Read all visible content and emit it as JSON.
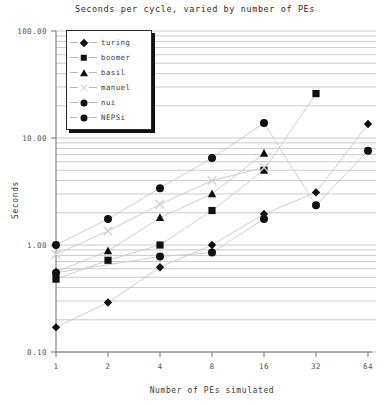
{
  "chart_data": {
    "type": "scatter",
    "title": "Seconds per cycle, varied by number of PEs",
    "xlabel": "Number of PEs simulated",
    "ylabel": "Seconds",
    "xscale": "log2",
    "yscale": "log10",
    "x": [
      1,
      2,
      4,
      8,
      16,
      32,
      64
    ],
    "xticklabels": [
      "1",
      "2",
      "4",
      "8",
      "16",
      "32",
      "64"
    ],
    "yticklabels": [
      "100.00",
      "10.00",
      "1.00",
      "0.10"
    ],
    "ytickvalues": [
      100,
      10,
      1,
      0.1
    ],
    "ylim": [
      0.1,
      100
    ],
    "grid": "horizontal-log-minor",
    "legend_position": "upper-left-inside",
    "series": [
      {
        "name": "turing",
        "marker": "diamond",
        "color": "#111111",
        "x": [
          1,
          2,
          4,
          8,
          16,
          32,
          64
        ],
        "values": [
          0.17,
          0.29,
          0.62,
          1.0,
          1.95,
          3.1,
          13.5
        ]
      },
      {
        "name": "boomer",
        "marker": "square",
        "color": "#111111",
        "x": [
          1,
          2,
          4,
          8,
          16,
          32
        ],
        "values": [
          0.48,
          0.72,
          1.0,
          2.1,
          5.0,
          26.0
        ]
      },
      {
        "name": "basil",
        "marker": "triangle",
        "color": "#111111",
        "x": [
          1,
          2,
          4,
          8,
          16
        ],
        "values": [
          0.56,
          0.88,
          1.8,
          3.0,
          7.2
        ]
      },
      {
        "name": "manuel",
        "marker": "cross",
        "color": "#cfcfcf",
        "x": [
          1,
          2,
          4,
          8,
          16
        ],
        "values": [
          0.82,
          1.35,
          2.4,
          4.0,
          5.3
        ]
      },
      {
        "name": "nui",
        "marker": "circle",
        "color": "#111111",
        "x": [
          1,
          2,
          4,
          8,
          16,
          32,
          64
        ],
        "values": [
          1.0,
          1.75,
          3.4,
          6.5,
          13.8,
          2.35,
          7.6
        ]
      },
      {
        "name": "NEPSi",
        "marker": "circle",
        "color": "#111111",
        "x": [
          1,
          4,
          8,
          16
        ],
        "values": [
          0.55,
          0.78,
          0.85,
          1.75
        ]
      }
    ]
  },
  "legend": {
    "items": [
      {
        "label": "turing",
        "marker": "diamond"
      },
      {
        "label": "boomer",
        "marker": "square"
      },
      {
        "label": "basil",
        "marker": "triangle"
      },
      {
        "label": "manuel",
        "marker": "cross"
      },
      {
        "label": "nui",
        "marker": "circle"
      },
      {
        "label": "NEPSi",
        "marker": "circle"
      }
    ]
  }
}
